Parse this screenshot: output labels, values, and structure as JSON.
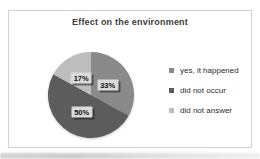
{
  "chart_data": {
    "type": "pie",
    "title": "Effect on the environment",
    "slices": [
      {
        "label": "yes, it happened",
        "value": 33,
        "display": "33%",
        "color": "#8a8a8a"
      },
      {
        "label": "did not occur",
        "value": 50,
        "display": "50%",
        "color": "#5c5c5c"
      },
      {
        "label": "did not answer",
        "value": 17,
        "display": "17%",
        "color": "#bdbdbd"
      }
    ],
    "start_angle_deg": 0,
    "direction": "clockwise",
    "legend_position": "right",
    "data_labels": "inside",
    "label_text_color": "#111111",
    "label_box_color": "#dadada"
  }
}
